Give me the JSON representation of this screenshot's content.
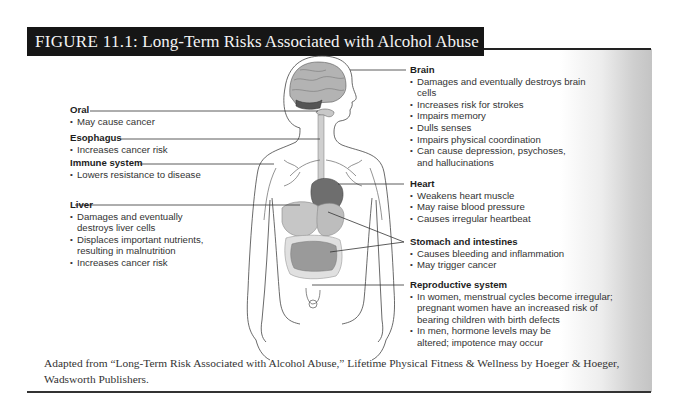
{
  "figure": {
    "number": "FIGURE 11.1:",
    "title": "Long-Term Risks Associated with Alcohol Abuse"
  },
  "labels": {
    "oral": {
      "heading": "Oral",
      "items": [
        "May cause cancer"
      ]
    },
    "esophagus": {
      "heading": "Esophagus",
      "items": [
        "Increases cancer risk"
      ]
    },
    "immune": {
      "heading": "Immune system",
      "items": [
        "Lowers resistance to disease"
      ]
    },
    "liver": {
      "heading": "Liver",
      "items": [
        "Damages and eventually destroys liver cells",
        "Displaces important nutrients, resulting in malnutrition",
        "Increases cancer risk"
      ]
    },
    "brain": {
      "heading": "Brain",
      "items": [
        "Damages and eventually destroys brain cells",
        "Increases risk for strokes",
        "Impairs memory",
        "Dulls senses",
        "Impairs physical coordination",
        "Can cause depression, psychoses, and hallucinations"
      ]
    },
    "heart": {
      "heading": "Heart",
      "items": [
        "Weakens heart muscle",
        "May raise blood pressure",
        "Causes irregular heartbeat"
      ]
    },
    "stomach": {
      "heading": "Stomach and intestines",
      "items": [
        "Causes bleeding and inflammation",
        "May trigger cancer"
      ]
    },
    "reproductive": {
      "heading": "Reproductive system",
      "items": [
        "In women, menstrual cycles become irregular; pregnant women have an increased risk of bearing children with birth defects",
        "In men, hormone levels may be altered; impotence may occur"
      ]
    }
  },
  "caption": {
    "text": "Adapted from “Long-Term Risk Associated with Alcohol Abuse,” Lifetime Physical Fitness & Wellness by Hoeger & Hoeger, Wadsworth Publishers."
  },
  "colors": {
    "title_bg": "#161616",
    "title_fg": "#f4f4f4",
    "organ_fill": "#bdbdbd",
    "organ_dark": "#7a7a7a",
    "line": "#333333"
  }
}
